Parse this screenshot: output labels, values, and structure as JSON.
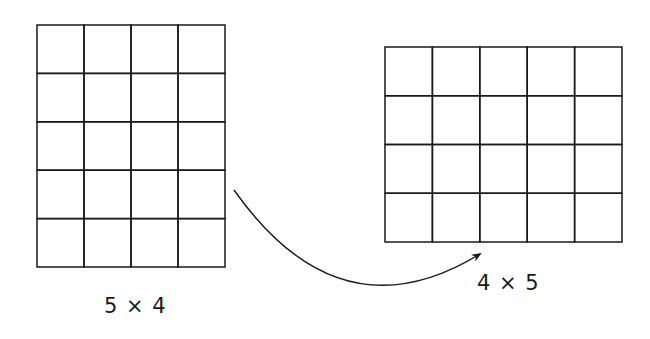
{
  "diagram": {
    "stroke_color": "#1a1a1a",
    "background": "#ffffff",
    "left_grid": {
      "rows": 5,
      "cols": 4,
      "x": 37,
      "y": 25,
      "width": 188,
      "height": 242,
      "label": "5 × 4",
      "label_pos": {
        "x": 104,
        "y": 294
      }
    },
    "right_grid": {
      "rows": 4,
      "cols": 5,
      "x": 385,
      "y": 47,
      "width": 237,
      "height": 195,
      "label": "4 × 5",
      "label_pos": {
        "x": 477,
        "y": 271
      }
    },
    "arrow": {
      "from": [
        234,
        190
      ],
      "control": [
        340,
        340
      ],
      "to": [
        480,
        254
      ],
      "meaning": "transforms into"
    }
  }
}
